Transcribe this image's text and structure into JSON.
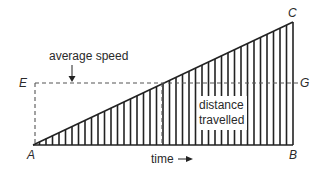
{
  "diagram": {
    "type": "speed-time graph (distance as area under line)",
    "points": {
      "A": {
        "label": "A",
        "x": 33,
        "y": 145
      },
      "B": {
        "label": "B",
        "x": 293,
        "y": 145
      },
      "C": {
        "label": "C",
        "x": 293,
        "y": 22
      },
      "E": {
        "label": "E",
        "x": 35,
        "y": 83
      },
      "G": {
        "label": "G",
        "x": 293,
        "y": 83
      }
    },
    "labels": {
      "average_speed": "average speed",
      "distance_line1": "distance",
      "distance_line2": "travelled",
      "time": "time"
    },
    "hatch": {
      "count": 40,
      "color": "#222222"
    },
    "colors": {
      "line": "#222222",
      "dashed": "#555555",
      "text": "#2a2a2a",
      "background": "#ffffff"
    }
  }
}
